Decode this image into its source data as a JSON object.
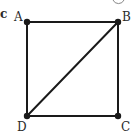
{
  "figure": {
    "type": "square-with-diagonal",
    "partial_label_left": "c",
    "vertices": [
      {
        "name": "A",
        "x": 27,
        "y": 22,
        "label_x": 16,
        "label_y": 21
      },
      {
        "name": "B",
        "x": 118,
        "y": 22,
        "label_x": 122,
        "label_y": 21
      },
      {
        "name": "C",
        "x": 118,
        "y": 116,
        "label_x": 121,
        "label_y": 131
      },
      {
        "name": "D",
        "x": 27,
        "y": 116,
        "label_x": 18,
        "label_y": 131
      }
    ],
    "edges": [
      [
        "A",
        "B"
      ],
      [
        "B",
        "C"
      ],
      [
        "C",
        "D"
      ],
      [
        "D",
        "A"
      ],
      [
        "B",
        "D"
      ]
    ],
    "colors": {
      "stroke": "#1a1a1a",
      "background": "#ffffff"
    }
  },
  "labels": {
    "a": "A",
    "b": "B",
    "c": "C",
    "d": "D",
    "left_fragment": "c"
  }
}
